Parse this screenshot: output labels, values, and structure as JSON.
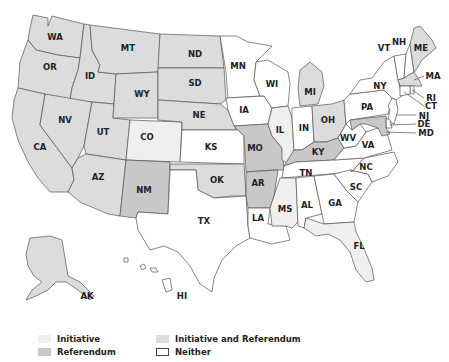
{
  "colors": {
    "initiative": "#efefef",
    "initiative_and_referendum": "#dcdcdc",
    "referendum": "#c8c8c8",
    "neither": "#ffffff",
    "border": "#555555"
  },
  "states": {
    "WA": {
      "label": "WA",
      "category": "initiative_and_referendum"
    },
    "OR": {
      "label": "OR",
      "category": "initiative_and_referendum"
    },
    "CA": {
      "label": "CA",
      "category": "initiative_and_referendum"
    },
    "ID": {
      "label": "ID",
      "category": "initiative_and_referendum"
    },
    "NV": {
      "label": "NV",
      "category": "initiative_and_referendum"
    },
    "UT": {
      "label": "UT",
      "category": "initiative_and_referendum"
    },
    "AZ": {
      "label": "AZ",
      "category": "initiative_and_referendum"
    },
    "MT": {
      "label": "MT",
      "category": "initiative_and_referendum"
    },
    "WY": {
      "label": "WY",
      "category": "initiative_and_referendum"
    },
    "CO": {
      "label": "CO",
      "category": "initiative"
    },
    "NM": {
      "label": "NM",
      "category": "referendum"
    },
    "ND": {
      "label": "ND",
      "category": "initiative_and_referendum"
    },
    "SD": {
      "label": "SD",
      "category": "initiative_and_referendum"
    },
    "NE": {
      "label": "NE",
      "category": "initiative_and_referendum"
    },
    "KS": {
      "label": "KS",
      "category": "neither"
    },
    "OK": {
      "label": "OK",
      "category": "initiative_and_referendum"
    },
    "TX": {
      "label": "TX",
      "category": "neither"
    },
    "MN": {
      "label": "MN",
      "category": "neither"
    },
    "IA": {
      "label": "IA",
      "category": "neither"
    },
    "MO": {
      "label": "MO",
      "category": "referendum"
    },
    "AR": {
      "label": "AR",
      "category": "referendum"
    },
    "LA": {
      "label": "LA",
      "category": "neither"
    },
    "WI": {
      "label": "WI",
      "category": "neither"
    },
    "IL": {
      "label": "IL",
      "category": "initiative"
    },
    "MI": {
      "label": "MI",
      "category": "initiative_and_referendum"
    },
    "IN": {
      "label": "IN",
      "category": "neither"
    },
    "OH": {
      "label": "OH",
      "category": "initiative_and_referendum"
    },
    "KY": {
      "label": "KY",
      "category": "referendum"
    },
    "TN": {
      "label": "TN",
      "category": "neither"
    },
    "MS": {
      "label": "MS",
      "category": "initiative"
    },
    "AL": {
      "label": "AL",
      "category": "neither"
    },
    "GA": {
      "label": "GA",
      "category": "neither"
    },
    "FL": {
      "label": "FL",
      "category": "initiative"
    },
    "SC": {
      "label": "SC",
      "category": "neither"
    },
    "NC": {
      "label": "NC",
      "category": "neither"
    },
    "VA": {
      "label": "VA",
      "category": "neither"
    },
    "WV": {
      "label": "WV",
      "category": "neither"
    },
    "PA": {
      "label": "PA",
      "category": "neither"
    },
    "NY": {
      "label": "NY",
      "category": "neither"
    },
    "VT": {
      "label": "VT",
      "category": "neither"
    },
    "NH": {
      "label": "NH",
      "category": "neither"
    },
    "ME": {
      "label": "ME",
      "category": "initiative_and_referendum"
    },
    "MA": {
      "label": "MA",
      "category": "initiative_and_referendum"
    },
    "RI": {
      "label": "RI",
      "category": "neither"
    },
    "CT": {
      "label": "CT",
      "category": "neither"
    },
    "NJ": {
      "label": "NJ",
      "category": "neither"
    },
    "DE": {
      "label": "DE",
      "category": "neither"
    },
    "MD": {
      "label": "MD",
      "category": "referendum"
    },
    "AK": {
      "label": "AK",
      "category": "initiative_and_referendum"
    },
    "HI": {
      "label": "HI",
      "category": "neither"
    }
  },
  "legend": {
    "items": [
      {
        "key": "initiative",
        "label": "Initiative"
      },
      {
        "key": "initiative_and_referendum",
        "label": "Initiative and Referendum"
      },
      {
        "key": "referendum",
        "label": "Referendum"
      },
      {
        "key": "neither",
        "label": "Neither"
      }
    ]
  }
}
